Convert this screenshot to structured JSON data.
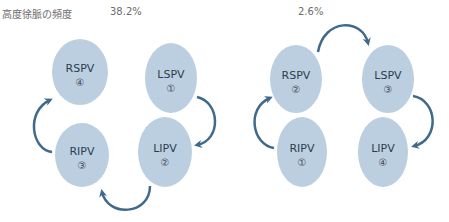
{
  "title": "高度徐脈の頻度",
  "colors": {
    "ellipse": "#bccfe0",
    "arrow": "#3f6a8c",
    "text": "#2b3e50"
  },
  "panels": [
    {
      "percent": "38.2%",
      "veins": [
        {
          "name": "RSPV",
          "order": "④"
        },
        {
          "name": "LSPV",
          "order": "①"
        },
        {
          "name": "RIPV",
          "order": "③"
        },
        {
          "name": "LIPV",
          "order": "②"
        }
      ]
    },
    {
      "percent": "2.6%",
      "veins": [
        {
          "name": "RSPV",
          "order": "②"
        },
        {
          "name": "LSPV",
          "order": "③"
        },
        {
          "name": "RIPV",
          "order": "①"
        },
        {
          "name": "LIPV",
          "order": "④"
        }
      ]
    }
  ]
}
